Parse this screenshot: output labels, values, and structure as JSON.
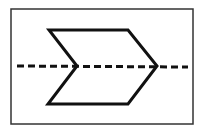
{
  "diagram": {
    "type": "geometric-figure",
    "frame": {
      "x": 11,
      "y": 9,
      "width": 182,
      "height": 115,
      "stroke": "#333333",
      "stroke_width": 1.5
    },
    "chevron": {
      "points": [
        [
          49,
          30
        ],
        [
          128,
          30
        ],
        [
          157,
          66
        ],
        [
          128,
          104
        ],
        [
          48,
          104
        ],
        [
          77,
          66
        ]
      ],
      "stroke": "#111111",
      "stroke_width": 3,
      "fill": "none"
    },
    "symmetry_line": {
      "x1": 17,
      "y1": 66,
      "x2": 188,
      "y2": 67,
      "stroke": "#111111",
      "stroke_width": 3,
      "dash": "7,4"
    },
    "colors": {
      "background": "#ffffff",
      "line": "#111111",
      "frame": "#333333"
    }
  }
}
